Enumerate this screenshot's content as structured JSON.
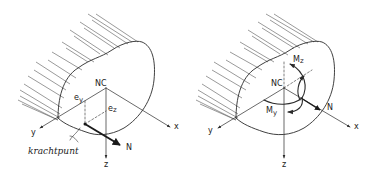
{
  "figures": [
    {
      "id": "left",
      "labels": {
        "centroid": "NC",
        "ey": "e",
        "ey_sub": "y",
        "ez": "e",
        "ez_sub": "z",
        "axis_x": "x",
        "axis_y": "y",
        "axis_z": "z",
        "force": "N",
        "point_label": "krachtpunt"
      }
    },
    {
      "id": "right",
      "labels": {
        "centroid": "NC",
        "mz": "M",
        "mz_sub": "z",
        "my": "M",
        "my_sub": "y",
        "axis_x": "x",
        "axis_y": "y",
        "axis_z": "z",
        "force": "N"
      }
    }
  ],
  "colors": {
    "ink": "#2a2a2a",
    "background": "#ffffff"
  }
}
